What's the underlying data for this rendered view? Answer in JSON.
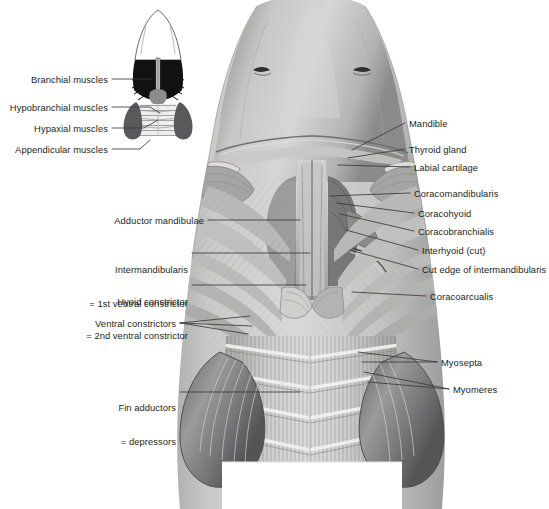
{
  "figure": {
    "background_color": "#ffffff",
    "text_color": "#231f20",
    "leader_color": "#3a3a3a"
  },
  "inset": {
    "name": "muscle-group-schematic",
    "regions": [
      {
        "key": "branchial",
        "color": "#111111",
        "label_ref": 0
      },
      {
        "key": "hypobranchial",
        "color": "#8c8c8c",
        "label_ref": 1
      },
      {
        "key": "hypaxial",
        "color": "#e3e3e3",
        "label_ref": 2
      },
      {
        "key": "appendicular",
        "color": "#59595b",
        "label_ref": 3
      },
      {
        "key": "rostrum",
        "color": "#ffffff",
        "label_ref": null
      }
    ],
    "labels": [
      {
        "text": "Branchial muscles",
        "x": 108,
        "y": 82,
        "align": "right"
      },
      {
        "text": "Hypobranchial muscles",
        "x": 108,
        "y": 110,
        "align": "right"
      },
      {
        "text": "Hypaxial muscles",
        "x": 108,
        "y": 131,
        "align": "right"
      },
      {
        "text": "Appendicular muscles",
        "x": 108,
        "y": 152,
        "align": "right"
      }
    ]
  },
  "labels_left": [
    {
      "text": "Adductor mandibulae",
      "lines": [
        "Adductor mandibulae"
      ],
      "x": 204,
      "y": 223,
      "align": "right"
    },
    {
      "text": "Intermandibularis = 1st ventral constrictor",
      "lines": [
        "Intermandibularis",
        "= 1st ventral constrictor"
      ],
      "x": 188,
      "y": 251,
      "align": "right"
    },
    {
      "text": "Hyoid constrictor = 2nd ventral constrictor",
      "lines": [
        "Hyoid constrictor",
        "= 2nd ventral constrictor"
      ],
      "x": 188,
      "y": 283,
      "align": "right"
    },
    {
      "text": "Ventral constrictors",
      "lines": [
        "Ventral constrictors"
      ],
      "x": 176,
      "y": 326,
      "align": "right"
    },
    {
      "text": "Fin adductors = depressors",
      "lines": [
        "Fin adductors",
        "= depressors"
      ],
      "x": 176,
      "y": 389,
      "align": "right"
    }
  ],
  "labels_right": [
    {
      "text": "Mandible",
      "x": 409,
      "y": 126
    },
    {
      "text": "Thyroid gland",
      "x": 409,
      "y": 152
    },
    {
      "text": "Labial cartilage",
      "x": 414,
      "y": 170
    },
    {
      "text": "Coracomandibularis",
      "x": 414,
      "y": 196
    },
    {
      "text": "Coracohyoid",
      "x": 418,
      "y": 216
    },
    {
      "text": "Coracobranchialis",
      "x": 418,
      "y": 234
    },
    {
      "text": "Interhyoid (cut)",
      "x": 422,
      "y": 253
    },
    {
      "text": "Cut edge of intermandibularis",
      "x": 422,
      "y": 272
    },
    {
      "text": "Coracoarcualis",
      "x": 430,
      "y": 299
    },
    {
      "text": "Myosepta",
      "x": 441,
      "y": 365
    },
    {
      "text": "Myomeres",
      "x": 453,
      "y": 392
    }
  ]
}
